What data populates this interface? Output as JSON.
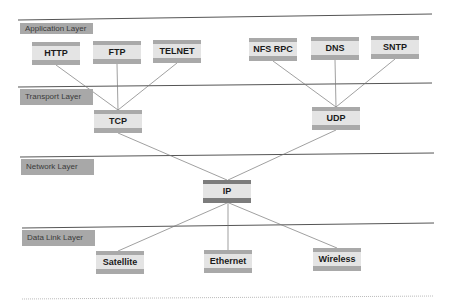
{
  "diagram": {
    "layers": [
      {
        "id": "application",
        "label": "Application Layer"
      },
      {
        "id": "transport",
        "label": "Transport Layer"
      },
      {
        "id": "network",
        "label": "Network Layer"
      },
      {
        "id": "datalink",
        "label": "Data Link Layer"
      }
    ],
    "nodes": {
      "http": "HTTP",
      "ftp": "FTP",
      "telnet": "TELNET",
      "nfs_rpc": "NFS RPC",
      "dns": "DNS",
      "sntp": "SNTP",
      "tcp": "TCP",
      "udp": "UDP",
      "ip": "IP",
      "satellite": "Satellite",
      "ethernet": "Ethernet",
      "wireless": "Wireless"
    },
    "edges": [
      [
        "HTTP",
        "TCP"
      ],
      [
        "FTP",
        "TCP"
      ],
      [
        "TELNET",
        "TCP"
      ],
      [
        "NFS RPC",
        "UDP"
      ],
      [
        "DNS",
        "UDP"
      ],
      [
        "SNTP",
        "UDP"
      ],
      [
        "TCP",
        "IP"
      ],
      [
        "UDP",
        "IP"
      ],
      [
        "IP",
        "Satellite"
      ],
      [
        "IP",
        "Ethernet"
      ],
      [
        "IP",
        "Wireless"
      ]
    ],
    "colors": {
      "label_bg": "#a8a8a8",
      "node_band": "#a9a9a9",
      "ip_band": "#7c7c7c",
      "node_fill": "#e4e4e4",
      "line": "#666666"
    }
  }
}
